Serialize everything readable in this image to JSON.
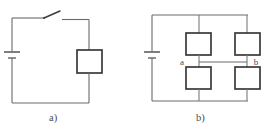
{
  "figure": {
    "background_color": "#ffffff",
    "wire_color": "#6a6a6a",
    "component_outline_color": "#3a3a3a",
    "text_color": "#4a4a4a",
    "width": 265,
    "height": 133
  },
  "circuits": [
    {
      "id": "circuit-a",
      "caption": "a)",
      "components": {
        "battery": {
          "name": "battery",
          "orientation": "vertical",
          "position": "left-side"
        },
        "switch": {
          "name": "switch",
          "state": "open",
          "position": "top"
        },
        "resistors": [
          {
            "name": "resistor",
            "position": "right-side"
          }
        ]
      },
      "nodes": []
    },
    {
      "id": "circuit-b",
      "caption": "b)",
      "components": {
        "battery": {
          "name": "battery",
          "orientation": "vertical",
          "position": "left-side"
        },
        "switch": null,
        "resistors": [
          {
            "name": "resistor",
            "position": "top-left"
          },
          {
            "name": "resistor",
            "position": "top-right"
          },
          {
            "name": "resistor",
            "position": "bottom-left"
          },
          {
            "name": "resistor",
            "position": "bottom-right"
          }
        ]
      },
      "nodes": [
        {
          "label": "a",
          "position": "middle-left"
        },
        {
          "label": "b",
          "position": "middle-right"
        }
      ]
    }
  ]
}
